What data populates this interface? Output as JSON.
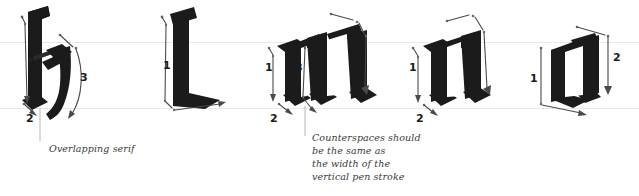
{
  "figure": {
    "background_color": "#ffffff",
    "ink_color": "#1b1b1b",
    "guideline_color": "#e9e9e9",
    "arrow_color": "#4a4a4a",
    "leader_color": "#b6b6b6",
    "guidelines": [
      {
        "name": "x-height-line",
        "y": 42
      },
      {
        "name": "baseline",
        "y": 108
      }
    ]
  },
  "letters": [
    {
      "glyph": "h",
      "stroke_numbers": [
        "1",
        "2",
        "3"
      ],
      "annotation": "Overlapping serif"
    },
    {
      "glyph": "l",
      "stroke_numbers": [
        "1"
      ],
      "annotation": ""
    },
    {
      "glyph": "m",
      "stroke_numbers": [
        "1",
        "2",
        "3",
        "4"
      ],
      "annotation": "Counterspaces should\nbe the same as\nthe width of the\nvertical pen stroke"
    },
    {
      "glyph": "n",
      "stroke_numbers": [
        "1",
        "2",
        "3"
      ],
      "annotation": ""
    },
    {
      "glyph": "o",
      "stroke_numbers": [
        "1",
        "2"
      ],
      "annotation": ""
    }
  ],
  "labels": {
    "h_1": "1",
    "h_2": "2",
    "h_3": "3",
    "l_1": "1",
    "m_1": "1",
    "m_2": "2",
    "m_3": "3",
    "m_4": "4",
    "n_1": "1",
    "n_2": "2",
    "n_3": "3",
    "o_1": "1",
    "o_2": "2"
  },
  "annotations": {
    "overlapping_serif": "Overlapping serif",
    "counterspaces": "Counterspaces should\nbe the same as\nthe width of the\nvertical pen stroke"
  }
}
